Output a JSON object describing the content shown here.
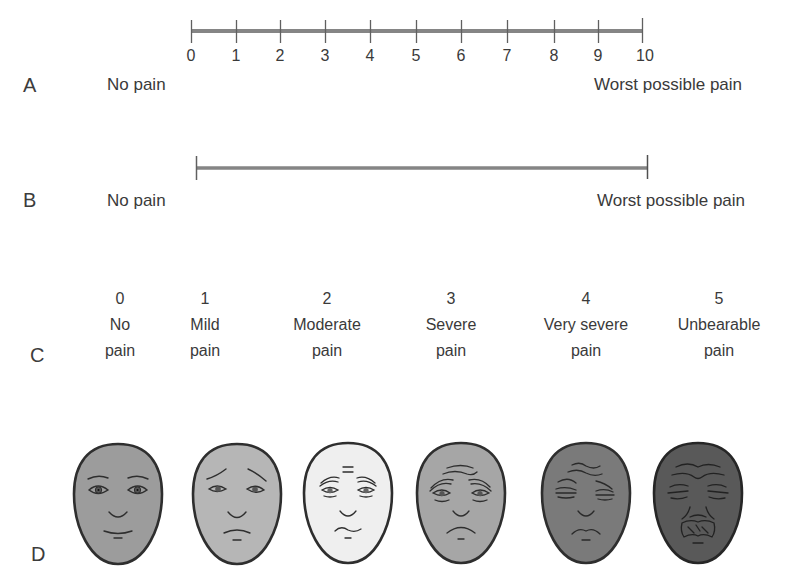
{
  "panels": {
    "A": {
      "letter": "A",
      "left_label": "No pain",
      "right_label": "Worst possible pain",
      "ticks": [
        "0",
        "1",
        "2",
        "3",
        "4",
        "5",
        "6",
        "7",
        "8",
        "9",
        "10"
      ]
    },
    "B": {
      "letter": "B",
      "left_label": "No pain",
      "right_label": "Worst possible pain"
    },
    "C": {
      "letter": "C",
      "items": [
        {
          "value": "0",
          "line1": "No",
          "line2": "pain"
        },
        {
          "value": "1",
          "line1": "Mild",
          "line2": "pain"
        },
        {
          "value": "2",
          "line1": "Moderate",
          "line2": "pain"
        },
        {
          "value": "3",
          "line1": "Severe",
          "line2": "pain"
        },
        {
          "value": "4",
          "line1": "Very severe",
          "line2": "pain"
        },
        {
          "value": "5",
          "line1": "Unbearable",
          "line2": "pain"
        }
      ]
    },
    "D": {
      "letter": "D",
      "faces": [
        {
          "expression": "no-pain",
          "fill": "#9c9c9c"
        },
        {
          "expression": "mild-pain",
          "fill": "#b6b6b6"
        },
        {
          "expression": "moderate-pain",
          "fill": "#efefef"
        },
        {
          "expression": "severe-pain",
          "fill": "#a6a6a6"
        },
        {
          "expression": "very-severe-pain",
          "fill": "#7a7a7a"
        },
        {
          "expression": "unbearable-pain",
          "fill": "#595959"
        }
      ]
    }
  },
  "colors": {
    "scale_line": "#808080",
    "outline": "#2e2e2e",
    "text": "#3a3a3a"
  }
}
